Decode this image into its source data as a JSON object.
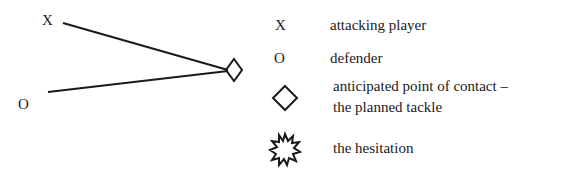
{
  "diagram": {
    "players": {
      "attacker_symbol": "X",
      "defender_symbol": "O"
    },
    "paths": [
      {
        "from": "attacker",
        "to": "contact-point"
      },
      {
        "from": "defender",
        "to": "contact-point"
      }
    ]
  },
  "legend": {
    "items": [
      {
        "symbol": "X",
        "icon": "x-glyph",
        "label": "attacking player"
      },
      {
        "symbol": "O",
        "icon": "o-glyph",
        "label": "defender"
      },
      {
        "symbol": "",
        "icon": "diamond-icon",
        "label_line1": "anticipated point of contact –",
        "label_line2": "the planned tackle"
      },
      {
        "symbol": "",
        "icon": "starburst-icon",
        "label": "the hesitation"
      }
    ]
  },
  "colors": {
    "ink": "#1a1a1a",
    "background": "#ffffff"
  }
}
